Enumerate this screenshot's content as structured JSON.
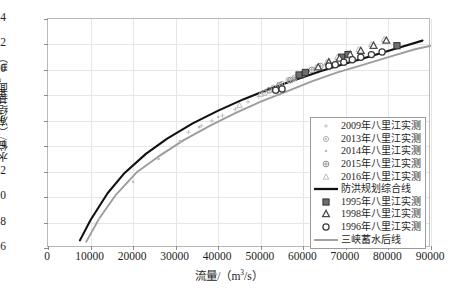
{
  "chart_data": {
    "type": "scatter",
    "title": "",
    "xlabel": "流量/（m³/s）",
    "ylabel": "水位/（冻结基面，m）",
    "xlim": [
      0,
      90000
    ],
    "ylim": [
      6,
      24
    ],
    "xticks": [
      0,
      10000,
      20000,
      30000,
      40000,
      50000,
      60000,
      70000,
      80000,
      90000
    ],
    "yticks": [
      6,
      8,
      10,
      12,
      14,
      16,
      18,
      20,
      22,
      24
    ],
    "xtick_labels": [
      "0",
      "10000",
      "20000",
      "30000",
      "40000",
      "50000",
      "60000",
      "70000",
      "80000",
      "90000"
    ],
    "ytick_labels": [
      "6",
      "8",
      "10",
      "12",
      "14",
      "16",
      "18",
      "20",
      "22",
      "24"
    ],
    "grid": true,
    "legend_position": "lower-right",
    "series": [
      {
        "name": "2009年八里江实测",
        "marker": "plus-small",
        "color": "#b7b7b7",
        "points": [
          [
            33000,
            15.1
          ],
          [
            36000,
            15.6
          ],
          [
            38500,
            16.0
          ],
          [
            41000,
            16.4
          ],
          [
            44000,
            16.9
          ],
          [
            47000,
            17.5
          ],
          [
            49500,
            17.9
          ]
        ]
      },
      {
        "name": "2013年八里江实测",
        "marker": "circle-dot",
        "color": "#a8a8a8",
        "points": [
          [
            51000,
            18.2
          ],
          [
            53000,
            18.6
          ],
          [
            55000,
            18.9
          ],
          [
            56500,
            19.2
          ],
          [
            58000,
            19.4
          ],
          [
            59500,
            19.6
          ]
        ]
      },
      {
        "name": "2014年八里江实测",
        "marker": "dot",
        "color": "#bcbcbc",
        "points": [
          [
            12000,
            8.3
          ],
          [
            20000,
            11.2
          ],
          [
            26000,
            13.0
          ],
          [
            31000,
            14.4
          ],
          [
            35500,
            15.5
          ],
          [
            40000,
            16.3
          ]
        ]
      },
      {
        "name": "2015年八里江实测",
        "marker": "circle-cross",
        "color": "#8f8f8f",
        "points": [
          [
            52000,
            18.4
          ],
          [
            54500,
            18.8
          ],
          [
            57000,
            19.2
          ],
          [
            60000,
            19.7
          ],
          [
            62000,
            20.0
          ],
          [
            64000,
            20.3
          ]
        ]
      },
      {
        "name": "2016年八里江实测",
        "marker": "triangle-light",
        "color": "#b3b3b3",
        "points": [
          [
            45000,
            17.2
          ],
          [
            50000,
            18.1
          ],
          [
            54000,
            18.8
          ],
          [
            57500,
            19.3
          ],
          [
            60500,
            19.8
          ],
          [
            63000,
            20.2
          ],
          [
            65500,
            20.6
          ],
          [
            68000,
            21.0
          ],
          [
            70500,
            21.3
          ],
          [
            73000,
            21.6
          ],
          [
            76000,
            22.0
          ],
          [
            79000,
            22.4
          ]
        ]
      },
      {
        "name": "防洪规划综合线",
        "marker": "line",
        "color": "#111111",
        "points": [
          [
            7500,
            6.6
          ],
          [
            10000,
            8.2
          ],
          [
            14000,
            10.3
          ],
          [
            18000,
            11.9
          ],
          [
            23000,
            13.4
          ],
          [
            28000,
            14.6
          ],
          [
            34000,
            15.8
          ],
          [
            40000,
            16.8
          ],
          [
            46000,
            17.7
          ],
          [
            52000,
            18.5
          ],
          [
            58000,
            19.2
          ],
          [
            64000,
            19.9
          ],
          [
            70000,
            20.5
          ],
          [
            76000,
            21.1
          ],
          [
            82000,
            21.7
          ],
          [
            88000,
            22.3
          ]
        ]
      },
      {
        "name": "1995年八里江实测",
        "marker": "square-dark",
        "color": "#555555",
        "points": [
          [
            59000,
            19.6
          ],
          [
            60500,
            19.8
          ],
          [
            69000,
            21.0
          ],
          [
            70500,
            21.2
          ],
          [
            82000,
            21.9
          ]
        ]
      },
      {
        "name": "1998年八里江实测",
        "marker": "triangle-dark",
        "color": "#4a4a4a",
        "points": [
          [
            63500,
            20.2
          ],
          [
            66000,
            20.6
          ],
          [
            68500,
            20.9
          ],
          [
            71000,
            21.2
          ],
          [
            73500,
            21.5
          ],
          [
            76500,
            21.9
          ],
          [
            79500,
            22.3
          ]
        ]
      },
      {
        "name": "1996年八里江实测",
        "marker": "circle-open",
        "color": "#3a3a3a",
        "points": [
          [
            53500,
            18.4
          ],
          [
            55000,
            18.5
          ],
          [
            66000,
            20.3
          ],
          [
            67500,
            20.4
          ],
          [
            69500,
            20.6
          ],
          [
            71500,
            20.8
          ],
          [
            73500,
            21.0
          ],
          [
            76000,
            21.2
          ],
          [
            78500,
            21.4
          ]
        ]
      },
      {
        "name": "三峡蓄水后线",
        "marker": "line",
        "color": "#9d9d9d",
        "points": [
          [
            9000,
            6.5
          ],
          [
            12000,
            8.3
          ],
          [
            16000,
            10.2
          ],
          [
            21000,
            12.0
          ],
          [
            26000,
            13.2
          ],
          [
            32000,
            14.5
          ],
          [
            38000,
            15.6
          ],
          [
            44000,
            16.6
          ],
          [
            50000,
            17.5
          ],
          [
            56000,
            18.3
          ],
          [
            62000,
            19.1
          ],
          [
            68000,
            19.8
          ],
          [
            74000,
            20.4
          ],
          [
            80000,
            21.0
          ],
          [
            86000,
            21.6
          ],
          [
            90000,
            21.9
          ]
        ]
      }
    ]
  },
  "caption": {
    "text": ""
  }
}
